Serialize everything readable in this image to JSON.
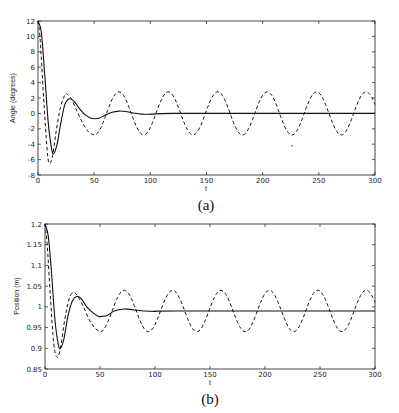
{
  "chart_data": [
    {
      "id": "a",
      "type": "line",
      "caption": "(a)",
      "title": "",
      "xlabel": "t",
      "ylabel": "Angle (degrees)",
      "xlim": [
        0,
        300
      ],
      "ylim": [
        -8,
        12
      ],
      "xticks": [
        0,
        50,
        100,
        150,
        200,
        250,
        300
      ],
      "yticks": [
        -8,
        -6,
        -4,
        -2,
        0,
        2,
        4,
        6,
        8,
        10,
        12
      ],
      "ytick_labels": [
        "-8",
        "-6",
        "-4",
        "-2",
        "0",
        "2",
        "4",
        "6",
        "8",
        "10",
        "12"
      ],
      "grid": false,
      "legend": null,
      "frame_px": {
        "left": 38,
        "top": 21,
        "right": 375,
        "bottom": 175
      },
      "series": [
        {
          "name": "solid",
          "style": "solid",
          "points": [
            [
              0,
              12
            ],
            [
              3,
              10.5
            ],
            [
              6,
              5
            ],
            [
              9,
              -1
            ],
            [
              12,
              -4.5
            ],
            [
              14,
              -5.2
            ],
            [
              17,
              -4
            ],
            [
              20,
              -1.5
            ],
            [
              24,
              1.2
            ],
            [
              28,
              1.9
            ],
            [
              32,
              1.6
            ],
            [
              37,
              0.6
            ],
            [
              42,
              -0.2
            ],
            [
              47,
              -0.6
            ],
            [
              50,
              -0.7
            ],
            [
              55,
              -0.6
            ],
            [
              60,
              -0.2
            ],
            [
              66,
              0.15
            ],
            [
              72,
              0.3
            ],
            [
              78,
              0.25
            ],
            [
              85,
              0.05
            ],
            [
              92,
              -0.1
            ],
            [
              100,
              -0.1
            ],
            [
              110,
              -0.03
            ],
            [
              120,
              0
            ],
            [
              140,
              0
            ],
            [
              300,
              0
            ]
          ]
        },
        {
          "name": "dashed",
          "style": "dashed",
          "amplitude": 2.8,
          "period": 44,
          "steady_start": 50,
          "points": [
            [
              0,
              12
            ],
            [
              2,
              9.5
            ],
            [
              5,
              2
            ],
            [
              8,
              -4.5
            ],
            [
              10,
              -6.5
            ],
            [
              13,
              -5.5
            ],
            [
              16,
              -2.5
            ],
            [
              20,
              0.8
            ],
            [
              24,
              2.4
            ],
            [
              26,
              2.5
            ],
            [
              30,
              1.8
            ],
            [
              35,
              0.2
            ],
            [
              40,
              -1.3
            ],
            [
              45,
              -2.4
            ],
            [
              50,
              -2.8
            ]
          ]
        }
      ],
      "annotations": [
        {
          "type": "dot",
          "x": 226,
          "y": -4.2
        }
      ]
    },
    {
      "id": "b",
      "type": "line",
      "caption": "(b)",
      "title": "",
      "xlabel": "t",
      "ylabel": "Position (m)",
      "xlim": [
        0,
        300
      ],
      "ylim": [
        0.85,
        1.2
      ],
      "xticks": [
        0,
        50,
        100,
        150,
        200,
        250,
        300
      ],
      "yticks": [
        0.85,
        0.9,
        0.95,
        1.0,
        1.05,
        1.1,
        1.15,
        1.2
      ],
      "ytick_labels": [
        "0.85",
        "0.9",
        "0.95",
        "1",
        "1.05",
        "1.1",
        "1.15",
        "1.2"
      ],
      "grid": false,
      "legend": null,
      "frame_px": {
        "left": 45,
        "top": 224,
        "right": 375,
        "bottom": 369
      },
      "series": [
        {
          "name": "solid",
          "style": "solid",
          "points": [
            [
              0,
              1.2
            ],
            [
              3,
              1.17
            ],
            [
              6,
              1.08
            ],
            [
              9,
              0.97
            ],
            [
              12,
              0.91
            ],
            [
              14,
              0.9
            ],
            [
              17,
              0.92
            ],
            [
              21,
              0.98
            ],
            [
              25,
              1.015
            ],
            [
              29,
              1.025
            ],
            [
              33,
              1.02
            ],
            [
              38,
              1.0
            ],
            [
              44,
              0.985
            ],
            [
              49,
              0.977
            ],
            [
              52,
              0.977
            ],
            [
              57,
              0.98
            ],
            [
              63,
              0.99
            ],
            [
              72,
              0.995
            ],
            [
              80,
              0.993
            ],
            [
              90,
              0.99
            ],
            [
              100,
              0.989
            ],
            [
              120,
              0.99
            ],
            [
              300,
              0.99
            ]
          ]
        },
        {
          "name": "dashed",
          "style": "dashed",
          "center": 0.99,
          "amplitude": 0.05,
          "period": 44,
          "steady_start": 50,
          "points": [
            [
              0,
              1.2
            ],
            [
              2,
              1.15
            ],
            [
              5,
              1.02
            ],
            [
              8,
              0.91
            ],
            [
              11,
              0.878
            ],
            [
              14,
              0.9
            ],
            [
              18,
              0.97
            ],
            [
              22,
              1.02
            ],
            [
              26,
              1.035
            ],
            [
              30,
              1.025
            ],
            [
              35,
              1.0
            ],
            [
              40,
              0.97
            ],
            [
              45,
              0.95
            ],
            [
              50,
              0.94
            ]
          ]
        }
      ],
      "annotations": []
    }
  ]
}
